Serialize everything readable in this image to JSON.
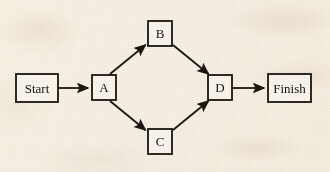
{
  "diagram": {
    "type": "flowchart",
    "background_color": "#f6f0e6",
    "stroke_color": "#1a1510",
    "text_color": "#16120c",
    "nodes": [
      {
        "id": "start",
        "label": "Start",
        "shape": "rectangle",
        "x": 16,
        "y": 74,
        "width": 42,
        "height": 28
      },
      {
        "id": "a",
        "label": "A",
        "shape": "rectangle",
        "x": 92,
        "y": 75,
        "width": 24,
        "height": 25
      },
      {
        "id": "b",
        "label": "B",
        "shape": "rectangle",
        "x": 148,
        "y": 21,
        "width": 24,
        "height": 25
      },
      {
        "id": "c",
        "label": "C",
        "shape": "rectangle",
        "x": 148,
        "y": 129,
        "width": 24,
        "height": 25
      },
      {
        "id": "d",
        "label": "D",
        "shape": "rectangle",
        "x": 208,
        "y": 75,
        "width": 24,
        "height": 25
      },
      {
        "id": "finish",
        "label": "Finish",
        "shape": "rectangle",
        "x": 268,
        "y": 74,
        "width": 43,
        "height": 28
      }
    ],
    "edges": [
      {
        "id": "start-a",
        "from": "start",
        "to": "a",
        "label": "",
        "arrowhead": "filled-triangle",
        "x1": 58,
        "y1": 88,
        "x2": 90,
        "y2": 88
      },
      {
        "id": "a-b",
        "from": "a",
        "to": "b",
        "label": "",
        "arrowhead": "filled-triangle",
        "x1": 110,
        "y1": 74,
        "x2": 147,
        "y2": 43
      },
      {
        "id": "a-c",
        "from": "a",
        "to": "c",
        "label": "",
        "arrowhead": "filled-triangle",
        "x1": 110,
        "y1": 101,
        "x2": 147,
        "y2": 132
      },
      {
        "id": "b-d",
        "from": "b",
        "to": "d",
        "label": "",
        "arrowhead": "filled-triangle",
        "x1": 173,
        "y1": 43,
        "x2": 210,
        "y2": 74
      },
      {
        "id": "c-d",
        "from": "c",
        "to": "d",
        "label": "",
        "arrowhead": "filled-triangle",
        "x1": 173,
        "y1": 132,
        "x2": 210,
        "y2": 101
      },
      {
        "id": "d-finish",
        "from": "d",
        "to": "finish",
        "label": "",
        "arrowhead": "filled-triangle",
        "x1": 232,
        "y1": 88,
        "x2": 266,
        "y2": 88
      }
    ]
  }
}
